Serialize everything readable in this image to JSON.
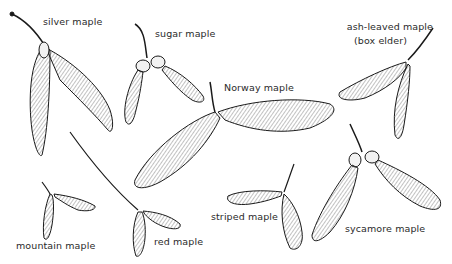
{
  "labels": {
    "silver_maple": "silver maple",
    "sugar_maple": "sugar maple",
    "norway_maple": "Norway maple",
    "ash_leaved_maple_line1": "ash-leaved maple",
    "ash_leaved_maple_line2": "(box elder)",
    "mountain_maple": "mountain maple",
    "red_maple": "red maple",
    "striped_maple": "striped maple",
    "sycamore_maple": "sycamore maple"
  },
  "colors": {
    "background": "#ffffff",
    "ink": "#1a1a1a",
    "wing_fill": "#f2f2f2",
    "label": "#2a2a2a"
  }
}
